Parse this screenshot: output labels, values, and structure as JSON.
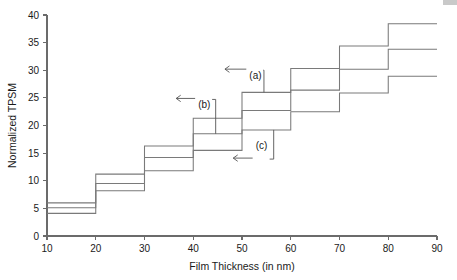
{
  "chart_data": {
    "type": "line",
    "subtype": "step-post",
    "title": "",
    "xlabel": "Film Thickness (in nm)",
    "ylabel": "Normalized TPSM",
    "xlim": [
      10,
      90
    ],
    "ylim": [
      0,
      40
    ],
    "xticks": [
      10,
      20,
      30,
      40,
      50,
      60,
      70,
      80,
      90
    ],
    "yticks": [
      0,
      5,
      10,
      15,
      20,
      25,
      30,
      35,
      40
    ],
    "xtick_labels": [
      "10",
      "20",
      "30",
      "40",
      "50",
      "60",
      "70",
      "80",
      "90"
    ],
    "ytick_labels": [
      "0",
      "5",
      "10",
      "15",
      "20",
      "25",
      "30",
      "35",
      "40"
    ],
    "grid": false,
    "legend": "none",
    "bin_edges": [
      10,
      20,
      30,
      40,
      50,
      60,
      70,
      80,
      90
    ],
    "categories": [
      "10-20",
      "20-30",
      "30-40",
      "40-50",
      "50-60",
      "60-70",
      "70-80",
      "80-90"
    ],
    "series": [
      {
        "name": "(a)",
        "annotation": "(a)",
        "values": [
          6.0,
          11.2,
          16.3,
          21.3,
          26.0,
          30.3,
          34.4,
          38.4
        ]
      },
      {
        "name": "(b)",
        "annotation": "(b)",
        "values": [
          5.1,
          9.5,
          14.2,
          18.5,
          22.7,
          26.4,
          30.2,
          33.8
        ]
      },
      {
        "name": "(c)",
        "annotation": "(c)",
        "values": [
          4.1,
          8.2,
          11.8,
          15.5,
          19.2,
          22.5,
          25.9,
          28.9
        ]
      }
    ],
    "annotations": [
      {
        "label": "(a)",
        "target_series": "(a)",
        "text_x": 51.5,
        "text_y": 28.4,
        "arrow_tip_x": 46.5,
        "arrow_tip_y": 30.2,
        "leader_x": 54.5,
        "leader_y": 26.0
      },
      {
        "label": "(b)",
        "target_series": "(b)",
        "text_x": 41.0,
        "text_y": 23.2,
        "arrow_tip_x": 36.5,
        "arrow_tip_y": 24.9,
        "leader_x": 44.6,
        "leader_y": 18.5
      },
      {
        "label": "(c)",
        "target_series": "(c)",
        "text_x": 52.8,
        "text_y": 15.7,
        "arrow_tip_x": 48.2,
        "arrow_tip_y": 14.1,
        "leader_x": 56.5,
        "leader_y": 19.2
      }
    ],
    "colors": {
      "line": "#7a7a7a",
      "axis": "#6b6b6b",
      "text": "#1a1a1a",
      "annotation": "#555555",
      "background": "#ffffff"
    }
  }
}
